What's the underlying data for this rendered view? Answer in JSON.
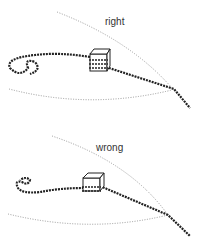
{
  "panels": [
    {
      "label": "right"
    },
    {
      "label": "wrong"
    }
  ],
  "colors": {
    "chain": "#222222",
    "guide_line": "#999999",
    "background": "#ffffff"
  }
}
